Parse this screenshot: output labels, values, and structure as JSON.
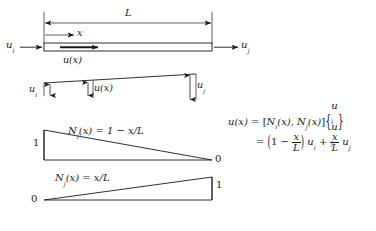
{
  "figure": {
    "stroke_color": "#1a1a1a",
    "background": "#ffffff",
    "panels": [
      {
        "id": "bar-element",
        "name": "bar-element-diagram",
        "length_label": "L",
        "axis_label": "x",
        "left_node_label": "u",
        "left_node_sub": "i",
        "right_node_label": "u",
        "right_node_sub": "j",
        "interior_label": "u(x)"
      },
      {
        "id": "displacement",
        "name": "displacement-distribution-diagram",
        "left_label": "u",
        "left_sub": "i",
        "mid_label": "u(x)",
        "right_label": "u",
        "right_sub": "j"
      },
      {
        "id": "shape-function-i",
        "name": "shape-function-ni-diagram",
        "equation": "N_i(x) = 1 - x/L",
        "eq_fn": "N",
        "eq_fn_sub": "i",
        "eq_arg": "(x)",
        "eq_rhs": "= 1 − x/L",
        "left_value": "1",
        "right_value": "0"
      },
      {
        "id": "shape-function-j",
        "name": "shape-function-nj-diagram",
        "equation": "N_j(x) = x/L",
        "eq_fn": "N",
        "eq_fn_sub": "j",
        "eq_arg": "(x)",
        "eq_rhs": "= x/L",
        "left_value": "0",
        "right_value": "1"
      }
    ],
    "equations": {
      "line1": {
        "lhs": "u(x)",
        "eq": "=",
        "row_open": "[",
        "term1_fn": "N",
        "term1_sub": "i",
        "term1_arg": "(x),",
        "term2_fn": "N",
        "term2_sub": "j",
        "term2_arg": "(x)",
        "row_close": "]",
        "vec_open": "{",
        "vec1": "u",
        "vec1_sub": "i",
        "vec2": "u",
        "vec2_sub": "j",
        "vec_close": "}"
      },
      "line2": {
        "eq": "=",
        "paren_open": "(",
        "one": "1",
        "minus": "−",
        "frac1_num": "x",
        "frac1_den": "L",
        "paren_close": ")",
        "u_i": "u",
        "u_i_sub": "i",
        "plus": "+",
        "frac2_num": "x",
        "frac2_den": "L",
        "u_j": "u",
        "u_j_sub": "j"
      }
    }
  }
}
